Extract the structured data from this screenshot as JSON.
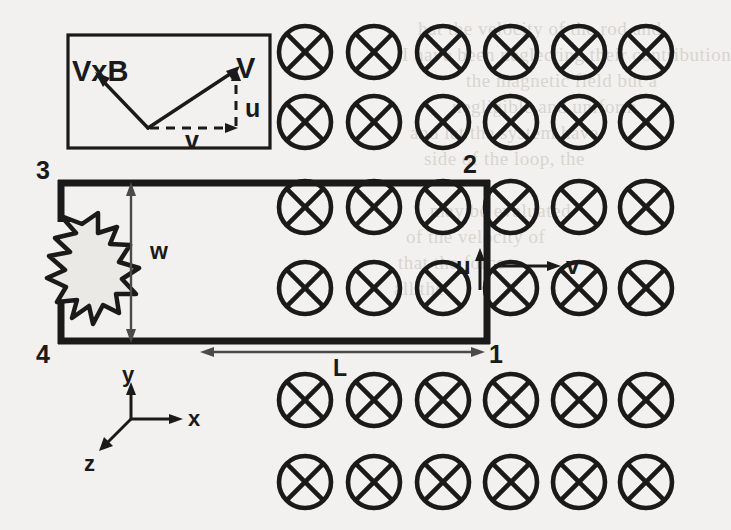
{
  "figure": {
    "background_color": "#f2f1ef",
    "ink_color": "#1a1a1a"
  },
  "ghost_text": [
    {
      "text": "hat the velocity of the rod and",
      "x": 418,
      "y": 18
    },
    {
      "text": "I have been neglecting their contribution",
      "x": 402,
      "y": 44
    },
    {
      "text": "the magnetic field but a",
      "x": 466,
      "y": 70
    },
    {
      "text": "negligible and uniform",
      "x": 452,
      "y": 96
    },
    {
      "text": "and let the system have",
      "x": 410,
      "y": 122
    },
    {
      "text": "side of the loop, the",
      "x": 424,
      "y": 148
    },
    {
      "text": "may be evaluated",
      "x": 430,
      "y": 200
    },
    {
      "text": "of the velocity of",
      "x": 406,
      "y": 226
    },
    {
      "text": "that the force",
      "x": 398,
      "y": 252
    },
    {
      "text": "all the",
      "x": 394,
      "y": 278
    }
  ],
  "inset": {
    "name": "velocity-decomposition-inset",
    "vectors": [
      {
        "id": "vxb",
        "label": "VxB",
        "style": "solid",
        "direction": "up-left"
      },
      {
        "id": "V",
        "label": "V",
        "style": "solid",
        "direction": "up-right"
      },
      {
        "id": "v",
        "label": "v",
        "style": "dashed",
        "direction": "right"
      },
      {
        "id": "u",
        "label": "u",
        "style": "dashed",
        "direction": "up"
      }
    ]
  },
  "loop": {
    "name": "conducting-loop",
    "corner_labels": [
      {
        "id": "corner-3",
        "label": "3",
        "position": "top-left"
      },
      {
        "id": "corner-2",
        "label": "2",
        "position": "top-right"
      },
      {
        "id": "corner-1",
        "label": "1",
        "position": "bottom-right"
      },
      {
        "id": "corner-4",
        "label": "4",
        "position": "bottom-left"
      }
    ],
    "dimensions": [
      {
        "id": "width-dimension",
        "label": "w",
        "orientation": "vertical"
      },
      {
        "id": "length-dimension",
        "label": "L",
        "orientation": "horizontal"
      }
    ],
    "element": {
      "id": "load-star",
      "shape": "star",
      "points": 7
    },
    "velocity_labels": [
      {
        "id": "u-velocity",
        "label": "u",
        "direction": "up"
      },
      {
        "id": "v-velocity",
        "label": "v",
        "direction": "right"
      }
    ]
  },
  "field": {
    "name": "magnetic-field-into-page",
    "symbol": "circle-x-icon",
    "columns_x": [
      305,
      374,
      443,
      511,
      579,
      646
    ],
    "rows_y": [
      52,
      122,
      207,
      288,
      400,
      482
    ],
    "radius": 26
  },
  "axes": {
    "name": "coordinate-axes",
    "origin": {
      "x": 131,
      "y": 419
    },
    "items": [
      {
        "id": "axis-y",
        "label": "y",
        "direction": "up"
      },
      {
        "id": "axis-x",
        "label": "x",
        "direction": "right"
      },
      {
        "id": "axis-z",
        "label": "z",
        "direction": "down-left"
      }
    ]
  }
}
